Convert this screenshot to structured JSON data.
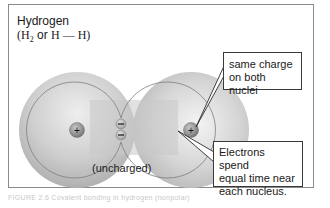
{
  "figure": {
    "title": "Hydrogen",
    "formula": {
      "open_paren": "(",
      "element": "H",
      "subscript": "2",
      "conjunction": " or ",
      "bond": "H — H",
      "close_paren": ")"
    },
    "molecule": {
      "nuclei": [
        {
          "id": "left",
          "charge": "+",
          "cx": 77,
          "cy": 130
        },
        {
          "id": "right",
          "charge": "+",
          "cx": 191,
          "cy": 130
        }
      ],
      "electrons": [
        {
          "charge": "−",
          "cx": 121,
          "cy": 124
        },
        {
          "charge": "−",
          "cx": 121,
          "cy": 135
        }
      ],
      "state_label": "(uncharged)"
    },
    "callouts": [
      {
        "id": "same-charge",
        "line1": "same charge",
        "line2": "on both nuclei"
      },
      {
        "id": "electrons-spend",
        "line1": "Electrons spend",
        "line2": "equal time near",
        "line3": "each nucleus."
      }
    ],
    "caption": "FIGURE 2.6  Covalent bonding in hydrogen (nonpolar)"
  },
  "colors": {
    "frame_border": "#8a8a8a",
    "molecule_fill": "#bdbdbd",
    "molecule_highlight": "#e9e9e9",
    "nucleus_fill": "#8f8f8f",
    "callout_border": "#3a3a3a",
    "text": "#1a1a1a"
  }
}
